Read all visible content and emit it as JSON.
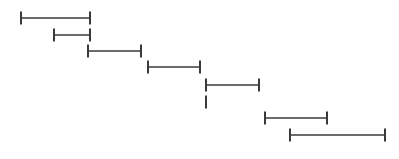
{
  "chart_data": {
    "type": "interval",
    "title": "",
    "xlabel": "",
    "ylabel": "",
    "grid": false,
    "legend": null,
    "cap_height": 13,
    "color": "#3a3a3a",
    "intervals": [
      {
        "row": 1,
        "start": 21,
        "end": 90,
        "y": 18
      },
      {
        "row": 2,
        "start": 54,
        "end": 90,
        "y": 35
      },
      {
        "row": 3,
        "start": 88,
        "end": 141,
        "y": 51
      },
      {
        "row": 4,
        "start": 148,
        "end": 200,
        "y": 67
      },
      {
        "row": 5,
        "start": 206,
        "end": 259,
        "y": 85
      },
      {
        "row": 6,
        "start": 206,
        "end": 206,
        "y": 102
      },
      {
        "row": 7,
        "start": 265,
        "end": 327,
        "y": 118
      },
      {
        "row": 8,
        "start": 290,
        "end": 385,
        "y": 135
      }
    ]
  }
}
